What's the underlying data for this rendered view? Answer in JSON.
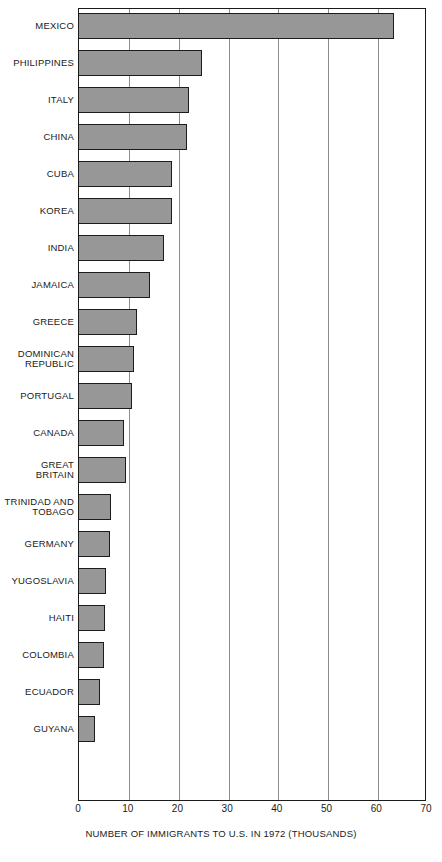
{
  "chart_data": {
    "type": "bar",
    "orientation": "horizontal",
    "title": "",
    "xlabel": "NUMBER OF IMMIGRANTS TO U.S. IN 1972 (THOUSANDS)",
    "ylabel": "",
    "xlim": [
      0,
      70
    ],
    "xticks": [
      0,
      10,
      20,
      30,
      40,
      50,
      60,
      70
    ],
    "xtick_labels": [
      "0",
      "10",
      "20",
      "30",
      "40",
      "50",
      "60",
      "70"
    ],
    "grid": true,
    "grid_axis": "x",
    "legend": false,
    "bar_color": "#979797",
    "bar_edge_color": "#1c1c1c",
    "categories": [
      "MEXICO",
      "PHILIPPINES",
      "ITALY",
      "CHINA",
      "CUBA",
      "KOREA",
      "INDIA",
      "JAMAICA",
      "GREECE",
      "DOMINICAN\nREPUBLIC",
      "PORTUGAL",
      "CANADA",
      "GREAT\nBRITAIN",
      "TRINIDAD AND\nTOBAGO",
      "GERMANY",
      "YUGOSLAVIA",
      "HAITI",
      "COLOMBIA",
      "ECUADOR",
      "GUYANA"
    ],
    "values": [
      63.5,
      25.0,
      22.4,
      22.0,
      19.0,
      18.9,
      17.2,
      14.4,
      11.8,
      11.2,
      10.8,
      9.2,
      9.6,
      6.6,
      6.4,
      5.6,
      5.4,
      5.2,
      4.4,
      3.4
    ]
  }
}
